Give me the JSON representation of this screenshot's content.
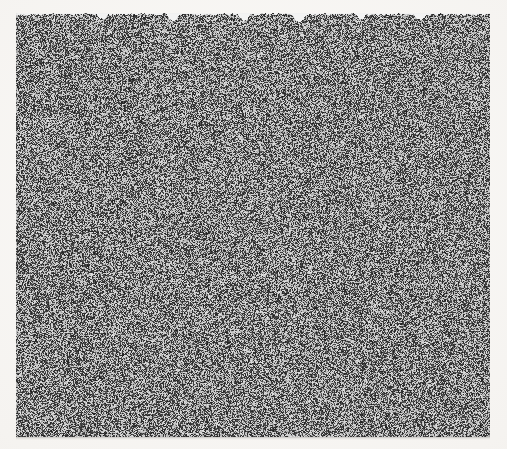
{
  "page": {
    "width": 507,
    "height": 449,
    "background_color": "#f6f4f1",
    "content_kind": "scanned-random-dot-noise-field",
    "visible_text": "",
    "alt_text": "Full-bleed field of fine random black-and-white dots on an off-white scanned page; no text, labels, axes or controls are legible."
  },
  "plate": {
    "x": 16,
    "y": 13,
    "width": 474,
    "height": 424,
    "dot_color": "#161514",
    "gap_color": "#f3f1ee",
    "fill_density_percent": 50,
    "dot_size_px": 1,
    "top_edge": "ragged, with small white notches at irregular intervals",
    "bottom_edge": "straight, with a faint gray scan fringe",
    "left_edge": "straight",
    "right_edge": "straight"
  },
  "margins": {
    "left": 16,
    "right": 17,
    "top": 13,
    "bottom": 12
  },
  "notches": [
    {
      "x": 96,
      "width": 11,
      "depth": 5
    },
    {
      "x": 166,
      "width": 13,
      "depth": 7
    },
    {
      "x": 238,
      "width": 12,
      "depth": 6
    },
    {
      "x": 292,
      "width": 14,
      "depth": 8
    },
    {
      "x": 356,
      "width": 10,
      "depth": 5
    },
    {
      "x": 414,
      "width": 12,
      "depth": 6
    }
  ],
  "render": {
    "seed": 20240517,
    "gray_low": 18,
    "gray_high": 242,
    "midtone_bias": 0.5
  }
}
